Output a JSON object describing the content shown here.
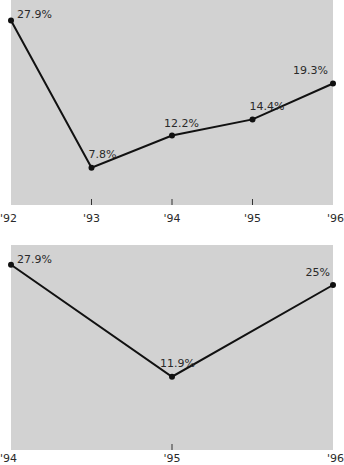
{
  "chart_data": [
    {
      "type": "line",
      "title": "",
      "xlabel": "",
      "ylabel": "",
      "categories": [
        "'92",
        "'93",
        "'94",
        "'95",
        "'96"
      ],
      "values": [
        27.9,
        7.8,
        12.2,
        14.4,
        19.3
      ],
      "data_labels": [
        "27.9%",
        "7.8%",
        "12.2%",
        "14.4%",
        "19.3%"
      ],
      "ylim": [
        0,
        30
      ],
      "grid": false,
      "legend": "none"
    },
    {
      "type": "line",
      "title": "",
      "xlabel": "",
      "ylabel": "",
      "categories": [
        "'94",
        "'95",
        "'96"
      ],
      "values": [
        27.9,
        11.9,
        25
      ],
      "data_labels": [
        "27.9%",
        "11.9%",
        "25%"
      ],
      "ylim": [
        0,
        30
      ],
      "grid": false,
      "legend": "none"
    }
  ]
}
